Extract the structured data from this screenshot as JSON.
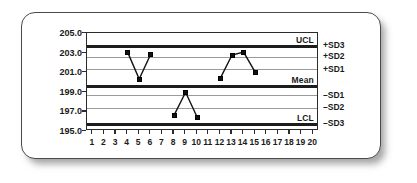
{
  "chart_data": {
    "type": "line",
    "title": "",
    "subtitle": "",
    "xlabel": "",
    "ylabel": "",
    "grid": true,
    "legend_position": "none",
    "xlim": [
      0.5,
      20.5
    ],
    "ylim": [
      195.0,
      205.0
    ],
    "x": [
      1,
      2,
      3,
      4,
      5,
      6,
      7,
      8,
      9,
      10,
      11,
      12,
      13,
      14,
      15,
      16,
      17,
      18,
      19,
      20
    ],
    "x_tick_labels": [
      "1",
      "2",
      "3",
      "4",
      "5",
      "6",
      "7",
      "8",
      "9",
      "10",
      "11",
      "12",
      "13",
      "14",
      "15",
      "16",
      "17",
      "18",
      "19",
      "20"
    ],
    "y_tick_labels": [
      "205.0",
      "203.0",
      "201.0",
      "199.0",
      "197.0",
      "195.0"
    ],
    "y_tick_values": [
      205.0,
      203.0,
      201.0,
      199.0,
      197.0,
      195.0
    ],
    "series": [
      {
        "name": "Observations",
        "points": [
          {
            "x": 4,
            "y": 203.05
          },
          {
            "x": 5,
            "y": 200.3
          },
          {
            "x": 6,
            "y": 202.85
          }
        ]
      },
      {
        "name": "Observations",
        "points": [
          {
            "x": 8,
            "y": 196.6
          },
          {
            "x": 9,
            "y": 198.95
          },
          {
            "x": 10,
            "y": 196.4
          }
        ]
      },
      {
        "name": "Observations",
        "points": [
          {
            "x": 12,
            "y": 200.4
          },
          {
            "x": 13,
            "y": 202.75
          },
          {
            "x": 14,
            "y": 203.05
          },
          {
            "x": 15,
            "y": 201.0
          }
        ]
      }
    ],
    "reference_lines": [
      {
        "label": "UCL",
        "value": 203.6,
        "side": "inside",
        "weight": "thick"
      },
      {
        "label": "+SD3",
        "value": 203.6,
        "side": "right",
        "weight": "thick"
      },
      {
        "label": "+SD2",
        "value": 202.55,
        "side": "right",
        "weight": "thin"
      },
      {
        "label": "+SD1",
        "value": 201.3,
        "side": "right",
        "weight": "thin"
      },
      {
        "label": "Mean",
        "value": 199.65,
        "side": "inside",
        "weight": "thick"
      },
      {
        "label": "-SD1",
        "value": 198.65,
        "side": "right",
        "weight": "thin"
      },
      {
        "label": "-SD2",
        "value": 197.35,
        "side": "right",
        "weight": "thin"
      },
      {
        "label": "LCL",
        "value": 195.8,
        "side": "inside",
        "weight": "thick"
      },
      {
        "label": "-SD3",
        "value": 195.8,
        "side": "right",
        "weight": "thick"
      }
    ]
  },
  "axis": {
    "y_labels": [
      "205.0",
      "203.0",
      "201.0",
      "199.0",
      "197.0",
      "195.0"
    ],
    "x_labels": [
      "1",
      "2",
      "3",
      "4",
      "5",
      "6",
      "7",
      "8",
      "9",
      "10",
      "11",
      "12",
      "13",
      "14",
      "15",
      "16",
      "17",
      "18",
      "19",
      "20"
    ]
  },
  "plot_labels": {
    "ucl": "UCL",
    "mean": "Mean",
    "lcl": "LCL"
  },
  "sigma_labels": {
    "plus_sd3": "+SD3",
    "plus_sd2": "+SD2",
    "plus_sd1": "+SD1",
    "minus_sd1": "–SD1",
    "minus_sd2": "–SD2",
    "minus_sd3": "–SD3"
  },
  "colors": {
    "major_line": "#1c1c1c",
    "minor_line": "#9a9a9a",
    "marker": "#111111",
    "frame": "#2b2b2b",
    "card_border": "#4a4a4a",
    "text": "#1a1a1a",
    "background": "#ffffff"
  }
}
